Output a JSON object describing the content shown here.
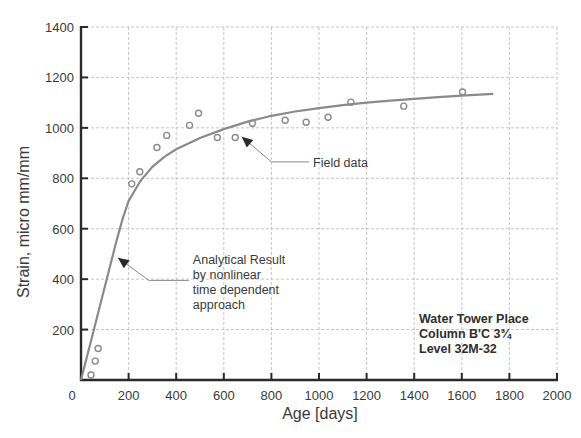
{
  "chart_data": {
    "type": "scatter",
    "title": "",
    "xlabel": "Age [days]",
    "ylabel": "Strain, micro mm/mm",
    "xlim": [
      0,
      2000
    ],
    "ylim": [
      0,
      1400
    ],
    "xticks": [
      0,
      200,
      400,
      600,
      800,
      1000,
      1200,
      1400,
      1600,
      1800,
      2000
    ],
    "yticks": [
      200,
      400,
      600,
      800,
      1000,
      1200,
      1400
    ],
    "xtick_labels": [
      "0",
      "200",
      "400",
      "600",
      "800",
      "1000",
      "1200",
      "1400",
      "1600",
      "1800",
      "2000"
    ],
    "ytick_labels": [
      "200",
      "400",
      "600",
      "800",
      "1000",
      "1200",
      "1400"
    ],
    "grid": true,
    "series": [
      {
        "name": "Field data",
        "kind": "scatter",
        "marker": "open-circle",
        "color": "#8a8a8a",
        "points": [
          [
            42,
            20
          ],
          [
            60,
            75
          ],
          [
            72,
            125
          ],
          [
            213,
            778
          ],
          [
            247,
            826
          ],
          [
            319,
            922
          ],
          [
            360,
            970
          ],
          [
            456,
            1010
          ],
          [
            494,
            1058
          ],
          [
            573,
            962
          ],
          [
            648,
            962
          ],
          [
            720,
            1018
          ],
          [
            858,
            1030
          ],
          [
            946,
            1022
          ],
          [
            1038,
            1042
          ],
          [
            1134,
            1102
          ],
          [
            1356,
            1086
          ],
          [
            1603,
            1142
          ]
        ]
      },
      {
        "name": "Analytical Result by nonlinear time dependent approach",
        "kind": "line",
        "color": "#8a8a8a",
        "points": [
          [
            0,
            0
          ],
          [
            50,
            185
          ],
          [
            100,
            370
          ],
          [
            150,
            555
          ],
          [
            175,
            640
          ],
          [
            200,
            710
          ],
          [
            250,
            790
          ],
          [
            300,
            845
          ],
          [
            350,
            885
          ],
          [
            400,
            915
          ],
          [
            500,
            960
          ],
          [
            600,
            995
          ],
          [
            700,
            1025
          ],
          [
            800,
            1048
          ],
          [
            900,
            1065
          ],
          [
            1000,
            1078
          ],
          [
            1100,
            1090
          ],
          [
            1200,
            1100
          ],
          [
            1300,
            1108
          ],
          [
            1400,
            1115
          ],
          [
            1500,
            1122
          ],
          [
            1600,
            1128
          ],
          [
            1732,
            1135
          ]
        ]
      }
    ],
    "annotations": [
      {
        "id": "field",
        "lines": [
          "Field data"
        ],
        "arrow_to": [
          675,
          965
        ],
        "elbow": [
          800,
          865
        ],
        "text_at": [
          975,
          860
        ]
      },
      {
        "id": "analytical",
        "lines": [
          "Analytical Result",
          "by nonlinear",
          "time dependent",
          "approach"
        ],
        "arrow_to": [
          155,
          485
        ],
        "elbow": [
          285,
          395
        ],
        "text_at": [
          470,
          395
        ]
      }
    ],
    "info_box": [
      "Water Tower Place",
      "Column B'C 3¾",
      "Level 32M-32"
    ],
    "legend": "none"
  }
}
